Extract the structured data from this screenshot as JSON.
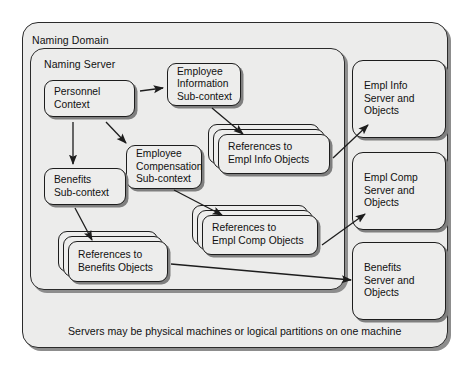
{
  "diagram": {
    "outer_container": {
      "label": "Naming Domain"
    },
    "inner_container": {
      "label": "Naming Server"
    },
    "caption": "Servers may be physical machines or logical partitions on one machine",
    "contexts": [
      {
        "name": "personnel-context",
        "label": "Personnel\nContext"
      },
      {
        "name": "employee-information-sub-context",
        "label": "Employee\nInformation\nSub-context"
      },
      {
        "name": "employee-compensation-sub-context",
        "label": "Employee\nCompensation\nSub-context"
      },
      {
        "name": "benefits-sub-context",
        "label": "Benefits\nSub-context"
      }
    ],
    "reference_stacks": [
      {
        "name": "references-to-empl-info-objects",
        "label": "References to\nEmpl Info Objects"
      },
      {
        "name": "references-to-empl-comp-objects",
        "label": "References to\nEmpl Comp Objects"
      },
      {
        "name": "references-to-benefits-objects",
        "label": "References to\nBenefits Objects"
      }
    ],
    "servers": [
      {
        "name": "empl-info-server",
        "label": "Empl Info\nServer and\nObjects"
      },
      {
        "name": "empl-comp-server",
        "label": "Empl Comp\nServer and\nObjects"
      },
      {
        "name": "benefits-server",
        "label": "Benefits\nServer and\nObjects"
      }
    ],
    "colors": {
      "panel_fill": "#ececeb",
      "node_fill": "#ededec",
      "stroke": "#1d1d1d",
      "shadow": "#7f7f7f",
      "background": "#ffffff"
    }
  }
}
